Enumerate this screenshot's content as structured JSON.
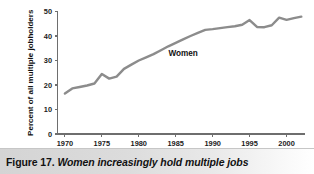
{
  "figure": {
    "caption_number": "Figure 17.",
    "caption_title": "Women increasingly hold multiple jobs",
    "background_color": "#ffffff",
    "caption_band_color": "#d4d4d4"
  },
  "chart_data": {
    "type": "line",
    "title": "",
    "xlabel": "",
    "ylabel": "Percent of all multiple jobholders",
    "xlim": [
      1969,
      2002.5
    ],
    "ylim": [
      0,
      50
    ],
    "grid": false,
    "legend_position": "inline-annotation",
    "line_color": "#8c8c8c",
    "axis_color": "#6e6e6e",
    "x_ticks": [
      1970,
      1975,
      1980,
      1985,
      1990,
      1995,
      2000
    ],
    "x_tick_labels": [
      "1970",
      "1975",
      "1980",
      "1985",
      "1990",
      "1995",
      "2000"
    ],
    "y_ticks": [
      0,
      10,
      20,
      30,
      40,
      50
    ],
    "y_tick_labels": [
      "0",
      "10",
      "20",
      "30",
      "40",
      "50"
    ],
    "annotations": [
      {
        "text": "Women",
        "x": 1986.0,
        "y": 32.0
      }
    ],
    "series": [
      {
        "name": "Women",
        "x": [
          1970,
          1971,
          1972,
          1973,
          1974,
          1975,
          1976,
          1977,
          1978,
          1979,
          1980,
          1981,
          1982,
          1983,
          1984,
          1985,
          1986,
          1987,
          1988,
          1989,
          1990,
          1991,
          1992,
          1993,
          1994,
          1995,
          1996,
          1997,
          1998,
          1999,
          2000,
          2001,
          2002
        ],
        "values": [
          16.5,
          18.6,
          19.2,
          19.8,
          20.6,
          24.5,
          22.6,
          23.4,
          26.6,
          28.3,
          30.0,
          31.3,
          32.6,
          34.2,
          35.8,
          37.2,
          38.6,
          40.0,
          41.3,
          42.5,
          42.8,
          43.2,
          43.6,
          44.0,
          44.6,
          46.5,
          43.7,
          43.6,
          44.4,
          47.5,
          46.6,
          47.3,
          47.9
        ]
      }
    ]
  }
}
